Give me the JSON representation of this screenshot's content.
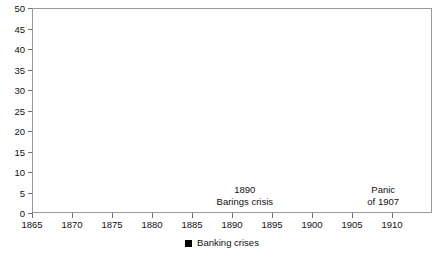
{
  "chart_data": {
    "type": "line",
    "title": "",
    "xlabel": "",
    "ylabel": "",
    "xlim": [
      1865,
      1915
    ],
    "ylim": [
      0,
      50
    ],
    "grid": false,
    "legend_position": "bottom-center",
    "line_color": "#6b6b6b",
    "band_color": "#000000",
    "frame_color": "#9a9a9a",
    "x_ticks": [
      1865,
      1870,
      1875,
      1880,
      1885,
      1890,
      1895,
      1900,
      1905,
      1910
    ],
    "x_tick_labels": [
      "1865",
      "1870",
      "1875",
      "1880",
      "1885",
      "1890",
      "1895",
      "1900",
      "1905",
      "1910"
    ],
    "y_ticks": [
      0,
      5,
      10,
      15,
      20,
      25,
      30,
      35,
      40,
      45,
      50
    ],
    "y_tick_labels": [
      "0",
      "5",
      "10",
      "15",
      "20",
      "25",
      "30",
      "35",
      "40",
      "45",
      "50"
    ],
    "series": [
      {
        "name": "series",
        "x": [
          1866,
          1867,
          1868,
          1869,
          1870,
          1871,
          1872,
          1873,
          1874,
          1875,
          1876,
          1877,
          1878,
          1879,
          1880,
          1881,
          1882,
          1883,
          1884,
          1885,
          1886,
          1887,
          1888,
          1889,
          1890,
          1891,
          1892,
          1893,
          1894,
          1895,
          1896,
          1897,
          1898,
          1899,
          1900,
          1901,
          1902,
          1903,
          1904,
          1905,
          1906,
          1907,
          1908,
          1909,
          1910,
          1911,
          1912,
          1913,
          1914
        ],
        "values": [
          0,
          1.2,
          3.2,
          4.2,
          5.5,
          9.3,
          8.6,
          13.0,
          16.5,
          13.0,
          7.2,
          4.5,
          4.8,
          4.2,
          6.2,
          4.2,
          8.8,
          13.5,
          11.5,
          10.6,
          11.2,
          30.3,
          19.5,
          2.0,
          44.8,
          19.5,
          22.5,
          19.0,
          9.5,
          6.5,
          4.3,
          5.0,
          10.3,
          12.5,
          7.0,
          6.3,
          11.5,
          6.4,
          9.8,
          5.5,
          29.2,
          15.5,
          7.0,
          20.0,
          16.5,
          26.0,
          37.5,
          38.5,
          23.0
        ]
      }
    ],
    "bands": [
      {
        "label": "banking-crisis-1866",
        "start": 1866.1,
        "end": 1867.2
      },
      {
        "label": "banking-crisis-1873",
        "start": 1873.1,
        "end": 1874.2
      },
      {
        "label": "banking-crisis-1907",
        "start": 1906.2,
        "end": 1907.3
      },
      {
        "label": "banking-crisis-1912",
        "start": 1911.9,
        "end": 1912.9
      }
    ],
    "annotations": [
      {
        "name": "barings-crisis",
        "line1": "1890",
        "line2": "Barings crisis",
        "x": 1891.6,
        "y": 7.0
      },
      {
        "name": "panic-of-1907",
        "line1": "Panic",
        "line2": "of 1907",
        "x": 1908.9,
        "y": 7.0
      }
    ],
    "legend": [
      {
        "name": "banking-crises",
        "label": "Banking crises",
        "color": "#000000",
        "marker": "square"
      }
    ]
  }
}
